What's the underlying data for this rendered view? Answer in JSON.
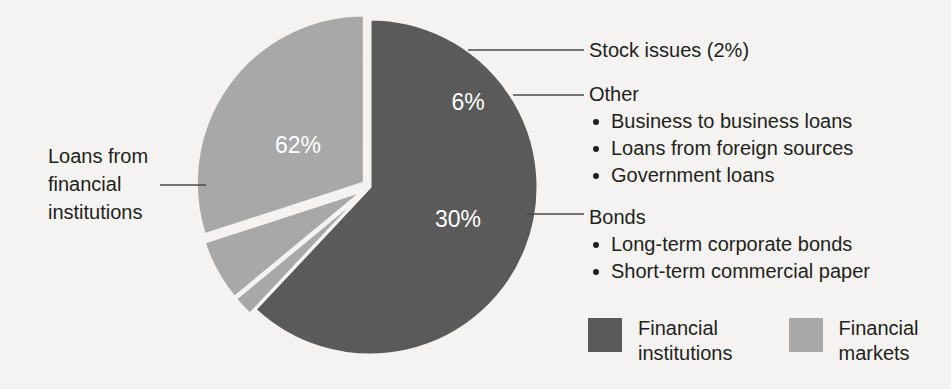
{
  "figure": {
    "background_color": "#f4f3f1",
    "text_color": "#231f20"
  },
  "chart_data": {
    "type": "pie",
    "title": "",
    "subtitle": "",
    "xlabel": "",
    "ylabel": "",
    "legend_position": "bottom-right",
    "grid": false,
    "center": {
      "x": 370,
      "y": 187
    },
    "radius": 168,
    "start_angle_deg": -90,
    "categories": [
      "Loans from financial institutions",
      "Stock issues",
      "Other",
      "Bonds"
    ],
    "values": [
      62,
      2,
      6,
      30
    ],
    "value_labels": [
      "62%",
      "",
      "6%",
      "30%"
    ],
    "slice_colors": [
      "#5a5a5a",
      "#a8a8a8",
      "#a8a8a8",
      "#a8a8a8"
    ],
    "separator_color": "#f4f3f1",
    "exploded": [
      false,
      true,
      true,
      true
    ],
    "groups": [
      {
        "name": "Financial institutions",
        "color": "#5a5a5a",
        "total": 62
      },
      {
        "name": "Financial markets",
        "color": "#a8a8a8",
        "total": 38
      }
    ],
    "annotations": [
      "Stock issues (2%)",
      "Other",
      "Bonds"
    ]
  },
  "labels": {
    "pct_institutions": "62%",
    "pct_other": "6%",
    "pct_bonds": "30%"
  },
  "left_callout": {
    "name": "loans-from-financial-institutions",
    "line1": "Loans from",
    "line2": "financial",
    "line3": "institutions"
  },
  "callouts": {
    "stock": {
      "title": "Stock issues (2%)",
      "items": []
    },
    "other": {
      "title": "Other",
      "items": [
        "Business to business loans",
        "Loans from foreign sources",
        "Government loans"
      ]
    },
    "bonds": {
      "title": "Bonds",
      "items": [
        "Long-term corporate bonds",
        "Short-term commercial paper"
      ]
    }
  },
  "legend": {
    "items": [
      {
        "label": "Financial\ninstitutions",
        "color": "#5a5a5a"
      },
      {
        "label": "Financial\nmarkets",
        "color": "#a8a8a8"
      }
    ]
  }
}
